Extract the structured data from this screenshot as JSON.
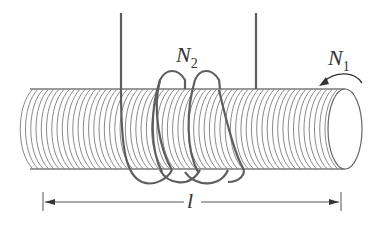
{
  "figure": {
    "labels": {
      "n1_main": "N",
      "n1_sub": "1",
      "n2_main": "N",
      "n2_sub": "2",
      "length": "l"
    },
    "colors": {
      "background": "#ffffff",
      "winding": "#8a8a8a",
      "wire": "#5e5e5e",
      "text": "#333333"
    },
    "primary_coil": {
      "name": "N1",
      "turns_drawn": 60
    },
    "secondary_coil": {
      "name": "N2",
      "loops_drawn": 3
    }
  }
}
